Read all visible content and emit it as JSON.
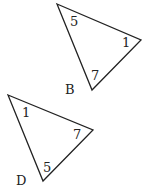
{
  "triangles": [
    {
      "name": "B",
      "vertices": [
        [
          57,
          4
        ],
        [
          141,
          40
        ],
        [
          92,
          90
        ]
      ],
      "angles": [
        {
          "label": "5",
          "x": 70,
          "y": 26
        },
        {
          "label": "1",
          "x": 122,
          "y": 47
        },
        {
          "label": "7",
          "x": 91,
          "y": 80
        }
      ],
      "name_pos": {
        "x": 65,
        "y": 94
      }
    },
    {
      "name": "D",
      "vertices": [
        [
          8,
          95
        ],
        [
          93,
          130
        ],
        [
          43,
          181
        ]
      ],
      "angles": [
        {
          "label": "1",
          "x": 22,
          "y": 117
        },
        {
          "label": "7",
          "x": 73,
          "y": 139
        },
        {
          "label": "5",
          "x": 43,
          "y": 172
        }
      ],
      "name_pos": {
        "x": 16,
        "y": 185
      }
    }
  ],
  "colors": {
    "stroke": "#222222",
    "background": "#ffffff"
  }
}
